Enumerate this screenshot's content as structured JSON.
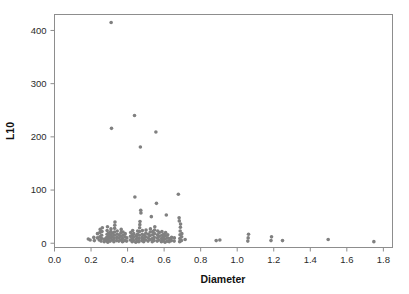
{
  "chart_data": {
    "type": "scatter",
    "title": "",
    "xlabel": "Diameter",
    "ylabel": "L10",
    "xlim": [
      0.0,
      1.85
    ],
    "ylim": [
      -8,
      430
    ],
    "grid": false,
    "legend": null,
    "marker": {
      "shape": "circle",
      "color": "#808080",
      "size_px": 3.6
    },
    "xticks": [
      0.0,
      0.2,
      0.4,
      0.6,
      0.8,
      1.0,
      1.2,
      1.4,
      1.6,
      1.8
    ],
    "xtick_labels": [
      "0.0",
      "0.2",
      "0.4",
      "0.6",
      "0.8",
      "1.0",
      "1.2",
      "1.4",
      "1.6",
      "1.8"
    ],
    "yticks": [
      0,
      100,
      200,
      300,
      400
    ],
    "ytick_labels": [
      "0",
      "100",
      "200",
      "300",
      "400"
    ],
    "n_points": 168,
    "points": [
      [
        0.185,
        8
      ],
      [
        0.195,
        6
      ],
      [
        0.215,
        11
      ],
      [
        0.218,
        5
      ],
      [
        0.235,
        10
      ],
      [
        0.235,
        18
      ],
      [
        0.245,
        6
      ],
      [
        0.248,
        12
      ],
      [
        0.248,
        20
      ],
      [
        0.25,
        26
      ],
      [
        0.255,
        4
      ],
      [
        0.258,
        9
      ],
      [
        0.258,
        15
      ],
      [
        0.26,
        22
      ],
      [
        0.262,
        29
      ],
      [
        0.272,
        3
      ],
      [
        0.274,
        8
      ],
      [
        0.285,
        5
      ],
      [
        0.286,
        11
      ],
      [
        0.288,
        17
      ],
      [
        0.288,
        24
      ],
      [
        0.29,
        31
      ],
      [
        0.292,
        2
      ],
      [
        0.294,
        7
      ],
      [
        0.295,
        13
      ],
      [
        0.296,
        19
      ],
      [
        0.305,
        4
      ],
      [
        0.306,
        10
      ],
      [
        0.307,
        16
      ],
      [
        0.308,
        22
      ],
      [
        0.309,
        27
      ],
      [
        0.31,
        415
      ],
      [
        0.312,
        216
      ],
      [
        0.315,
        6
      ],
      [
        0.316,
        12
      ],
      [
        0.317,
        19
      ],
      [
        0.325,
        3
      ],
      [
        0.326,
        9
      ],
      [
        0.327,
        15
      ],
      [
        0.328,
        21
      ],
      [
        0.329,
        28
      ],
      [
        0.33,
        34
      ],
      [
        0.331,
        40
      ],
      [
        0.34,
        5
      ],
      [
        0.341,
        11
      ],
      [
        0.342,
        17
      ],
      [
        0.343,
        23
      ],
      [
        0.352,
        4
      ],
      [
        0.353,
        10
      ],
      [
        0.354,
        16
      ],
      [
        0.362,
        6
      ],
      [
        0.363,
        13
      ],
      [
        0.364,
        20
      ],
      [
        0.365,
        26
      ],
      [
        0.372,
        3
      ],
      [
        0.373,
        9
      ],
      [
        0.374,
        15
      ],
      [
        0.375,
        21
      ],
      [
        0.385,
        5
      ],
      [
        0.386,
        12
      ],
      [
        0.387,
        18
      ],
      [
        0.395,
        4
      ],
      [
        0.396,
        10
      ],
      [
        0.415,
        6
      ],
      [
        0.416,
        13
      ],
      [
        0.417,
        20
      ],
      [
        0.425,
        3
      ],
      [
        0.426,
        9
      ],
      [
        0.427,
        16
      ],
      [
        0.428,
        24
      ],
      [
        0.432,
        5
      ],
      [
        0.433,
        12
      ],
      [
        0.434,
        18
      ],
      [
        0.438,
        240
      ],
      [
        0.44,
        87
      ],
      [
        0.445,
        2
      ],
      [
        0.446,
        8
      ],
      [
        0.447,
        14
      ],
      [
        0.452,
        4
      ],
      [
        0.453,
        10
      ],
      [
        0.454,
        17
      ],
      [
        0.455,
        23
      ],
      [
        0.462,
        3
      ],
      [
        0.463,
        9
      ],
      [
        0.464,
        15
      ],
      [
        0.465,
        22
      ],
      [
        0.466,
        29
      ],
      [
        0.467,
        35
      ],
      [
        0.468,
        41
      ],
      [
        0.47,
        181
      ],
      [
        0.472,
        62
      ],
      [
        0.473,
        57
      ],
      [
        0.478,
        5
      ],
      [
        0.479,
        11
      ],
      [
        0.48,
        17
      ],
      [
        0.481,
        24
      ],
      [
        0.488,
        3
      ],
      [
        0.489,
        9
      ],
      [
        0.49,
        15
      ],
      [
        0.498,
        6
      ],
      [
        0.499,
        12
      ],
      [
        0.5,
        19
      ],
      [
        0.501,
        25
      ],
      [
        0.512,
        4
      ],
      [
        0.513,
        10
      ],
      [
        0.514,
        17
      ],
      [
        0.522,
        7
      ],
      [
        0.523,
        14
      ],
      [
        0.524,
        21
      ],
      [
        0.525,
        27
      ],
      [
        0.53,
        50
      ],
      [
        0.535,
        3
      ],
      [
        0.536,
        9
      ],
      [
        0.537,
        16
      ],
      [
        0.538,
        22
      ],
      [
        0.545,
        5
      ],
      [
        0.546,
        11
      ],
      [
        0.547,
        18
      ],
      [
        0.548,
        25
      ],
      [
        0.549,
        31
      ],
      [
        0.555,
        209
      ],
      [
        0.558,
        75
      ],
      [
        0.562,
        4
      ],
      [
        0.563,
        10
      ],
      [
        0.564,
        16
      ],
      [
        0.565,
        23
      ],
      [
        0.572,
        6
      ],
      [
        0.573,
        13
      ],
      [
        0.574,
        20
      ],
      [
        0.585,
        3
      ],
      [
        0.586,
        9
      ],
      [
        0.587,
        15
      ],
      [
        0.588,
        22
      ],
      [
        0.595,
        5
      ],
      [
        0.596,
        11
      ],
      [
        0.597,
        17
      ],
      [
        0.605,
        2
      ],
      [
        0.606,
        8
      ],
      [
        0.607,
        14
      ],
      [
        0.608,
        20
      ],
      [
        0.612,
        53
      ],
      [
        0.618,
        4
      ],
      [
        0.619,
        10
      ],
      [
        0.62,
        16
      ],
      [
        0.628,
        3
      ],
      [
        0.629,
        9
      ],
      [
        0.64,
        5
      ],
      [
        0.641,
        11
      ],
      [
        0.655,
        4
      ],
      [
        0.656,
        10
      ],
      [
        0.678,
        92
      ],
      [
        0.682,
        48
      ],
      [
        0.683,
        42
      ],
      [
        0.685,
        3
      ],
      [
        0.686,
        9
      ],
      [
        0.687,
        16
      ],
      [
        0.688,
        23
      ],
      [
        0.689,
        30
      ],
      [
        0.69,
        36
      ],
      [
        0.695,
        5
      ],
      [
        0.696,
        12
      ],
      [
        0.697,
        18
      ],
      [
        0.715,
        7
      ],
      [
        0.885,
        5
      ],
      [
        0.905,
        6
      ],
      [
        1.058,
        4
      ],
      [
        1.06,
        10
      ],
      [
        1.062,
        17
      ],
      [
        1.185,
        5
      ],
      [
        1.188,
        12
      ],
      [
        1.248,
        5
      ],
      [
        1.498,
        7
      ],
      [
        1.748,
        3
      ]
    ]
  },
  "axes": {
    "x_title": "Diameter",
    "y_title": "L10"
  }
}
